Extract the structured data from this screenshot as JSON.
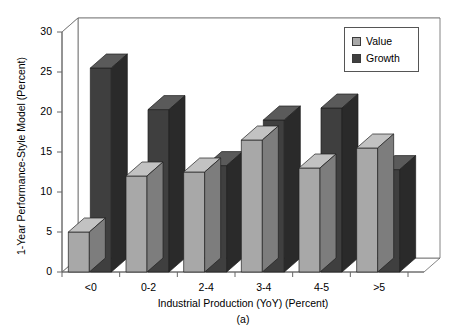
{
  "chart_data": {
    "type": "bar",
    "title": "",
    "subtitle": "",
    "caption": "(a)",
    "xlabel": "Industrial Production (YoY) (Percent)",
    "ylabel": "1-Year Performance-Style Model (Percent)",
    "categories": [
      "<0",
      "0-2",
      "2-4",
      "3-4",
      "4-5",
      ">5"
    ],
    "series": [
      {
        "name": "Value",
        "values": [
          5.0,
          12.0,
          12.5,
          16.5,
          13.0,
          15.5
        ],
        "color": "#a8a8a8"
      },
      {
        "name": "Growth",
        "values": [
          25.5,
          20.3,
          13.3,
          19.0,
          20.5,
          12.8
        ],
        "color": "#3f3f3f"
      }
    ],
    "ylim": [
      0,
      30
    ],
    "yticks": [
      0,
      5,
      10,
      15,
      20,
      25,
      30
    ],
    "ytick_labels": [
      "0",
      "5",
      "10",
      "15",
      "20",
      "25",
      "30"
    ],
    "grid": true,
    "grid_axis": "y",
    "legend_position": "top-right",
    "style": "3d-bar"
  },
  "legend": {
    "entries": [
      {
        "label": "Value",
        "swatch": "light-gray-swatch-icon"
      },
      {
        "label": "Growth",
        "swatch": "dark-gray-swatch-icon"
      }
    ]
  },
  "colors": {
    "value_face": "#a8a8a8",
    "value_top": "#c2c2c2",
    "value_side": "#7d7d7d",
    "growth_face": "#3f3f3f",
    "growth_top": "#5a5a5a",
    "growth_side": "#2a2a2a",
    "axis": "#666666",
    "grid": "#8c8c8c",
    "background": "#ffffff",
    "text": "#000000"
  }
}
